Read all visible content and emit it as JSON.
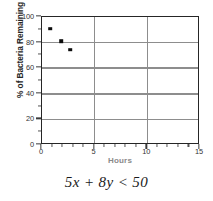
{
  "chart_data": {
    "type": "scatter",
    "title": "",
    "xlabel": "Hours",
    "ylabel": "% of Bacteria Remaining",
    "xlim": [
      0,
      15
    ],
    "ylim": [
      0,
      100
    ],
    "grid": true,
    "legend": "none",
    "x_ticks": [
      0,
      5,
      10,
      15
    ],
    "x_tick_labels": [
      "0",
      "5",
      "10",
      "15"
    ],
    "x_minor_step": 1,
    "y_ticks": [
      0,
      20,
      40,
      60,
      80,
      100
    ],
    "y_tick_labels": [
      "0",
      "20",
      "40",
      "60",
      "80",
      "100"
    ],
    "y_minor_step": 10,
    "series": [
      {
        "name": "Bacteria Remaining",
        "marker": "square",
        "color": "#0d0d0d",
        "points": [
          {
            "x": 0.8,
            "y": 91
          },
          {
            "x": 1.8,
            "y": 81
          },
          {
            "x": 2.7,
            "y": 74.5
          }
        ]
      }
    ],
    "gridline_color": "#8d8d8d",
    "frame_color": "#262626"
  },
  "caption": {
    "text": "5x + 8y < 50"
  }
}
